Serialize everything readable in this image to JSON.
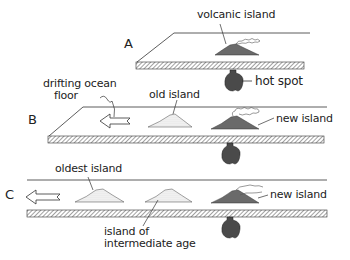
{
  "diagram": {
    "panels": [
      {
        "letter": "A",
        "labels": {
          "island": "volcanic island",
          "hotspot": "hot spot"
        }
      },
      {
        "letter": "B",
        "labels": {
          "drift": "drifting ocean floor",
          "drift_line1": "drifting ocean",
          "drift_line2": "floor",
          "old": "old island",
          "new": "new island"
        }
      },
      {
        "letter": "C",
        "labels": {
          "oldest": "oldest island",
          "intermediate_line1": "island of",
          "intermediate_line2": "intermediate age",
          "new": "new island"
        }
      }
    ],
    "colors": {
      "ink": "#222222",
      "volcano_fill": "#6a6a6a",
      "hotspot_fill": "#4a4a4a",
      "background": "#ffffff"
    }
  }
}
